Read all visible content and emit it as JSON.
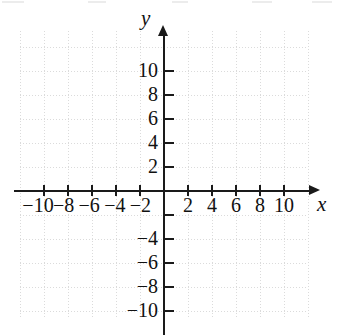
{
  "chart_data": {
    "type": "scatter",
    "title": "",
    "subtitle": "",
    "xlabel": "x",
    "ylabel": "y",
    "xlim": [
      -12,
      12
    ],
    "ylim": [
      -12,
      12
    ],
    "grid": true,
    "grid_spacing": 2,
    "legend": null,
    "series": [],
    "x_tick_values": [
      -10,
      -8,
      -6,
      -4,
      -2,
      2,
      4,
      6,
      8,
      10
    ],
    "y_tick_values": [
      10,
      8,
      6,
      4,
      2,
      -4,
      -6,
      -8,
      -10
    ],
    "x_tick_labels": [
      "−10",
      "−8",
      "−6",
      "−4",
      "−2",
      "2",
      "4",
      "6",
      "8",
      "10"
    ],
    "y_tick_labels": [
      "10",
      "8",
      "6",
      "4",
      "2",
      "−4",
      "−6",
      "−8",
      "−10"
    ],
    "unlabeled_ticks_note": "y = -2 and y = 0 and x = 0 ticks are unlabeled",
    "axis_arrows": [
      "x-positive",
      "y-positive"
    ]
  },
  "axes": {
    "x_label": "x",
    "y_label": "y"
  },
  "colors": {
    "axis": "#1a1a1a",
    "grid": "#d5d5d5",
    "text": "#111111",
    "background": "#ffffff"
  }
}
